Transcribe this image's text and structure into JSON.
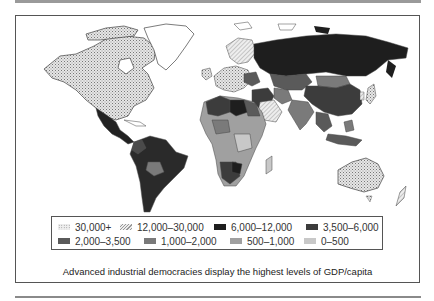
{
  "figure": {
    "caption": "Advanced industrial democracies display the highest levels of GDP/capita"
  },
  "legend": {
    "title": "",
    "items": [
      {
        "label": "30,000+",
        "pattern": "dotted",
        "color": "#d8d8d8"
      },
      {
        "label": "12,000–30,000",
        "pattern": "hatched",
        "color": "#e4e4e4"
      },
      {
        "label": "6,000–12,000",
        "pattern": "solid",
        "color": "#1e1e1e"
      },
      {
        "label": "3,500–6,000",
        "pattern": "solid",
        "color": "#3c3c3c"
      },
      {
        "label": "2,000–3,500",
        "pattern": "solid",
        "color": "#5a5a5a"
      },
      {
        "label": "1,000–2,000",
        "pattern": "solid",
        "color": "#7a7a7a"
      },
      {
        "label": "500–1,000",
        "pattern": "solid",
        "color": "#a0a0a0"
      },
      {
        "label": "0–500",
        "pattern": "solid",
        "color": "#c8c8c8"
      }
    ]
  },
  "map": {
    "subject": "World map of GDP per capita",
    "regions": [
      {
        "name": "North America (USA/Canada)",
        "class": "30,000+"
      },
      {
        "name": "Greenland",
        "class": "none"
      },
      {
        "name": "Mexico",
        "class": "6,000–12,000"
      },
      {
        "name": "South America",
        "class": "6,000–12,000"
      },
      {
        "name": "Bolivia",
        "class": "1,000–2,000"
      },
      {
        "name": "Western Europe",
        "class": "30,000+"
      },
      {
        "name": "Scandinavia",
        "class": "12,000–30,000"
      },
      {
        "name": "Russia",
        "class": "6,000–12,000"
      },
      {
        "name": "China",
        "class": "3,500–6,000"
      },
      {
        "name": "Mongolia",
        "class": "1,000–2,000"
      },
      {
        "name": "Middle East",
        "class": "12,000–30,000"
      },
      {
        "name": "North Africa",
        "class": "3,500–6,000"
      },
      {
        "name": "Sub-Saharan Africa",
        "class": "500–1,000"
      },
      {
        "name": "Southern Africa",
        "class": "3,500–6,000"
      },
      {
        "name": "India",
        "class": "1,000–2,000"
      },
      {
        "name": "Southeast Asia",
        "class": "2,000–3,500"
      },
      {
        "name": "Australia",
        "class": "30,000+"
      },
      {
        "name": "New Zealand",
        "class": "12,000–30,000"
      },
      {
        "name": "Japan",
        "class": "30,000+"
      }
    ]
  }
}
